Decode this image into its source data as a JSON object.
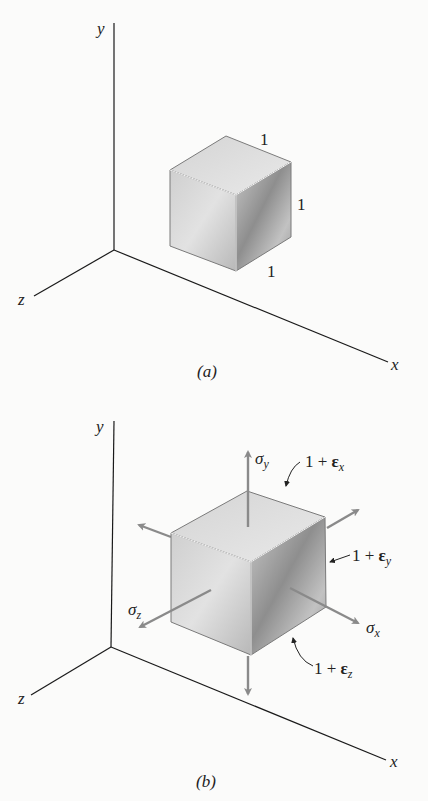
{
  "figure_a": {
    "caption": "(a)",
    "axes": {
      "x": "x",
      "y": "y",
      "z": "z"
    },
    "edge_labels": {
      "top": "1",
      "right": "1",
      "bottom": "1"
    }
  },
  "figure_b": {
    "caption": "(b)",
    "axes": {
      "x": "x",
      "y": "y",
      "z": "z"
    },
    "stress_labels": {
      "sigma_y": "σ",
      "sigma_y_sub": "y",
      "sigma_x": "σ",
      "sigma_x_sub": "x",
      "sigma_z": "σ",
      "sigma_z_sub": "z"
    },
    "strain_labels": {
      "ex_prefix": "1 + ",
      "ex_eps": "ε",
      "ex_sub": "x",
      "ey_prefix": "1 + ",
      "ey_eps": "ε",
      "ey_sub": "y",
      "ez_prefix": "1 + ",
      "ez_eps": "ε",
      "ez_sub": "z"
    }
  },
  "colors": {
    "axis": "#1a1a1a",
    "arrow": "#8a8a8a",
    "cube_edge": "#7a7a7a"
  }
}
